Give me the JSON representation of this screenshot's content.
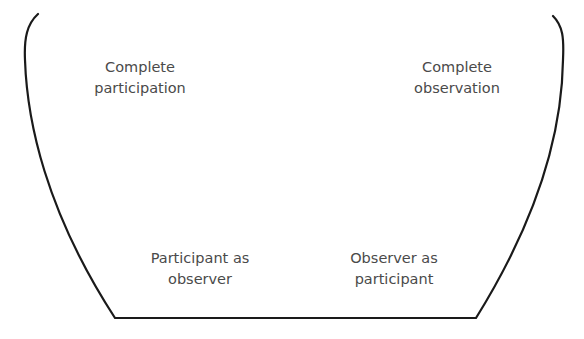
{
  "diagram": {
    "title": "",
    "shape": "open-top bowl",
    "colors": {
      "outline": "#1a1a1a",
      "text": "#4a4a4a",
      "background": "#ffffff"
    },
    "labels": [
      {
        "id": "complete-participation",
        "lines": [
          "Complete",
          "participation"
        ],
        "position": "top-left"
      },
      {
        "id": "complete-observation",
        "lines": [
          "Complete",
          "observation"
        ],
        "position": "top-right"
      },
      {
        "id": "participant-as-observer",
        "lines": [
          "Participant as",
          "observer"
        ],
        "position": "bottom-left"
      },
      {
        "id": "observer-as-participant",
        "lines": [
          "Observer as",
          "participant"
        ],
        "position": "bottom-right"
      }
    ]
  }
}
